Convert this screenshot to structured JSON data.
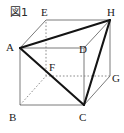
{
  "figure": {
    "caption": "図1",
    "type": "cube-solid-geometry-diagram",
    "vertices": [
      {
        "id": "A",
        "label": "A",
        "x": 20,
        "y": 48,
        "label_x": 6,
        "label_y": 42,
        "hidden": false
      },
      {
        "id": "B",
        "label": "B",
        "x": 20,
        "y": 105,
        "label_x": 9,
        "label_y": 112,
        "hidden": false
      },
      {
        "id": "C",
        "label": "C",
        "x": 84,
        "y": 105,
        "label_x": 79,
        "label_y": 112,
        "hidden": false
      },
      {
        "id": "D",
        "label": "D",
        "x": 84,
        "y": 48,
        "label_x": 79,
        "label_y": 44,
        "hidden": false
      },
      {
        "id": "E",
        "label": "E",
        "x": 46,
        "y": 20,
        "label_x": 41,
        "label_y": 7,
        "hidden": false
      },
      {
        "id": "F",
        "label": "F",
        "x": 46,
        "y": 76,
        "label_x": 49,
        "label_y": 62,
        "hidden": true
      },
      {
        "id": "G",
        "label": "G",
        "x": 110,
        "y": 76,
        "label_x": 112,
        "label_y": 73,
        "hidden": false
      },
      {
        "id": "H",
        "label": "H",
        "x": 110,
        "y": 20,
        "label_x": 107,
        "label_y": 7,
        "hidden": false
      }
    ],
    "edges": [
      {
        "from": "A",
        "to": "B",
        "style": "solid",
        "weight": "thin"
      },
      {
        "from": "B",
        "to": "C",
        "style": "solid",
        "weight": "thin"
      },
      {
        "from": "C",
        "to": "D",
        "style": "solid",
        "weight": "thin"
      },
      {
        "from": "D",
        "to": "A",
        "style": "solid",
        "weight": "thin"
      },
      {
        "from": "E",
        "to": "H",
        "style": "solid",
        "weight": "thin"
      },
      {
        "from": "H",
        "to": "G",
        "style": "solid",
        "weight": "thin"
      },
      {
        "from": "G",
        "to": "F",
        "style": "dotted",
        "weight": "thin"
      },
      {
        "from": "F",
        "to": "E",
        "style": "dotted",
        "weight": "thin"
      },
      {
        "from": "A",
        "to": "E",
        "style": "solid",
        "weight": "thin"
      },
      {
        "from": "B",
        "to": "F",
        "style": "dotted",
        "weight": "thin"
      },
      {
        "from": "C",
        "to": "G",
        "style": "solid",
        "weight": "thin"
      },
      {
        "from": "D",
        "to": "H",
        "style": "solid",
        "weight": "thin"
      }
    ],
    "highlighted_triangle": {
      "name": "triangle-AHC",
      "points": [
        "A",
        "H",
        "C"
      ],
      "edges": [
        {
          "from": "A",
          "to": "H",
          "style": "solid",
          "weight": "bold"
        },
        {
          "from": "H",
          "to": "C",
          "style": "solid",
          "weight": "bold"
        },
        {
          "from": "C",
          "to": "A",
          "style": "solid",
          "weight": "bold"
        }
      ]
    },
    "colors": {
      "edge_thin": "#7a7a7a",
      "edge_bold": "#141414",
      "hidden_edge": "#8c8c8c",
      "label_text": "#1a1a1a",
      "caption_text": "#2b2b2b",
      "background": "#ffffff"
    }
  }
}
